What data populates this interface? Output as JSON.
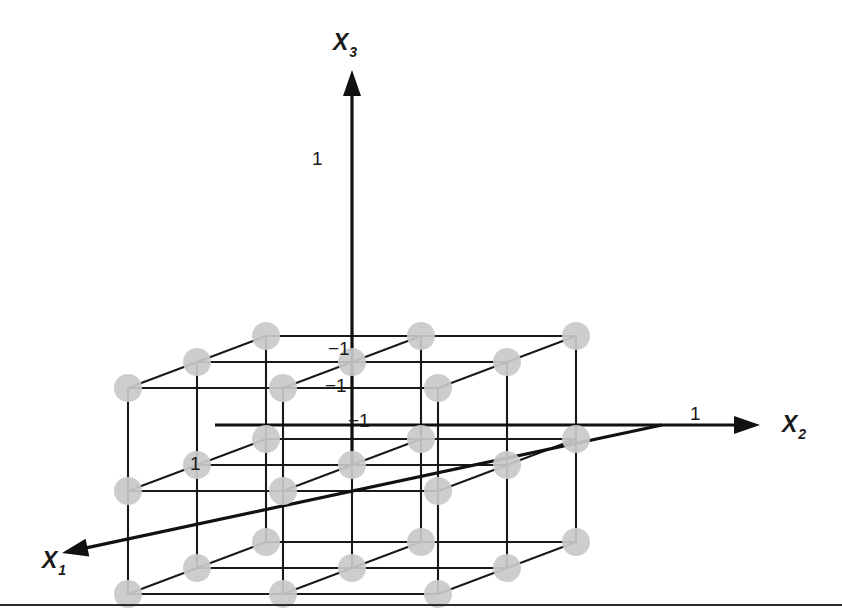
{
  "figure": {
    "title": "",
    "background_color": "#ffffff",
    "width": 842,
    "height": 614,
    "node_color": "#c9c9c9",
    "line_color": "#1a1a1a",
    "axis_color": "#111111",
    "footer_rule": true
  },
  "axes": [
    {
      "id": "x1",
      "label": "X",
      "subscript": "1",
      "label_x": 42,
      "label_y": 568,
      "direction": "down-left",
      "origin_x": 662,
      "origin_y": 425,
      "tip_x": 62,
      "tip_y": 553,
      "tick_label": "1",
      "tick_x": 190,
      "tick_y": 470
    },
    {
      "id": "x2",
      "label": "X",
      "subscript": "2",
      "label_x": 782,
      "label_y": 432,
      "direction": "right",
      "origin_x": 215,
      "origin_y": 425,
      "tip_x": 760,
      "tip_y": 425,
      "tick_label": "1",
      "tick_x": 690,
      "tick_y": 420
    },
    {
      "id": "x3",
      "label": "X",
      "subscript": "3",
      "label_x": 333,
      "label_y": 50,
      "direction": "up",
      "origin_x": 352,
      "origin_y": 465,
      "tip_x": 352,
      "tip_y": 70,
      "tick_label": "1",
      "tick_x": 312,
      "tick_y": 165
    }
  ],
  "origin_labels": [
    {
      "text": "−1",
      "x": 328,
      "y": 355,
      "axis": "x3"
    },
    {
      "text": "−1",
      "x": 325,
      "y": 392,
      "axis": "x1"
    },
    {
      "text": "−1",
      "x": 348,
      "y": 427,
      "axis": "x2"
    }
  ],
  "chart_data": {
    "type": "scatter",
    "title": "",
    "subtitle": "",
    "xlabel": "X1",
    "ylabel": "X2",
    "zlabel": "X3",
    "projection": "oblique",
    "levels": [
      -1,
      0,
      1
    ],
    "level_labels": [
      "−1",
      "0",
      "1"
    ],
    "axis_ranges": {
      "X1": [
        -1,
        1
      ],
      "X2": [
        -1,
        1
      ],
      "X3": [
        -1,
        1
      ]
    },
    "grid": true,
    "legend": "none",
    "n_points": 27,
    "points": [
      {
        "X1": -1,
        "X2": -1,
        "X3": -1
      },
      {
        "X1": -1,
        "X2": -1,
        "X3": 0
      },
      {
        "X1": -1,
        "X2": -1,
        "X3": 1
      },
      {
        "X1": -1,
        "X2": 0,
        "X3": -1
      },
      {
        "X1": -1,
        "X2": 0,
        "X3": 0
      },
      {
        "X1": -1,
        "X2": 0,
        "X3": 1
      },
      {
        "X1": -1,
        "X2": 1,
        "X3": -1
      },
      {
        "X1": -1,
        "X2": 1,
        "X3": 0
      },
      {
        "X1": -1,
        "X2": 1,
        "X3": 1
      },
      {
        "X1": 0,
        "X2": -1,
        "X3": -1
      },
      {
        "X1": 0,
        "X2": -1,
        "X3": 0
      },
      {
        "X1": 0,
        "X2": -1,
        "X3": 1
      },
      {
        "X1": 0,
        "X2": 0,
        "X3": -1
      },
      {
        "X1": 0,
        "X2": 0,
        "X3": 0
      },
      {
        "X1": 0,
        "X2": 0,
        "X3": 1
      },
      {
        "X1": 0,
        "X2": 1,
        "X3": -1
      },
      {
        "X1": 0,
        "X2": 1,
        "X3": 0
      },
      {
        "X1": 0,
        "X2": 1,
        "X3": 1
      },
      {
        "X1": 1,
        "X2": -1,
        "X3": -1
      },
      {
        "X1": 1,
        "X2": -1,
        "X3": 0
      },
      {
        "X1": 1,
        "X2": -1,
        "X3": 1
      },
      {
        "X1": 1,
        "X2": 0,
        "X3": -1
      },
      {
        "X1": 1,
        "X2": 0,
        "X3": 0
      },
      {
        "X1": 1,
        "X2": 0,
        "X3": 1
      },
      {
        "X1": 1,
        "X2": 1,
        "X3": -1
      },
      {
        "X1": 1,
        "X2": 1,
        "X3": 0
      },
      {
        "X1": 1,
        "X2": 1,
        "X3": 1
      }
    ],
    "projection_params": {
      "origin_px": [
        352,
        465
      ],
      "u_x2_px": [
        155,
        0
      ],
      "u_x3_px": [
        0,
        -103
      ],
      "u_x1_px": [
        -69,
        26
      ],
      "node_radius_px": 14
    }
  }
}
